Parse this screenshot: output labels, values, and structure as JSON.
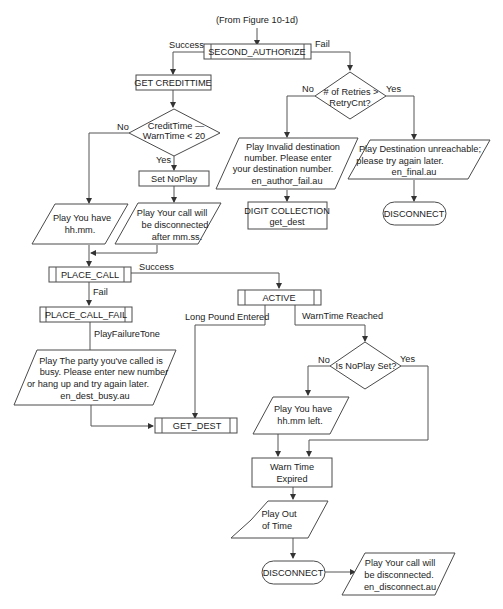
{
  "diagram": {
    "entry_label": "(From Figure 10-1d)",
    "nodes": {
      "second_authorize": "SECOND_AUTHORIZE",
      "get_credittime": "GET CREDITTIME",
      "credit_decision": [
        "CreditTime —",
        "WarnTime < 20"
      ],
      "set_noplay": "Set NoPlay",
      "play_you_have": [
        "Play  You have",
        "hh.mm."
      ],
      "play_disconnected_after": [
        "Play  Your call will",
        "be disconnected",
        "after mm.ss."
      ],
      "retries_decision": [
        "# of Retries >",
        "RetryCnt?"
      ],
      "play_invalid_dest": [
        "Play  Invalid destination",
        "number. Please enter",
        "your destination number.",
        "en_author_fail.au"
      ],
      "digit_collection": [
        "DIGIT COLLECTION",
        "get_dest"
      ],
      "play_dest_unreachable": [
        "Play  Destination unreachable;",
        "please try again later.",
        "en_final.au"
      ],
      "disconnect_top": "DISCONNECT",
      "place_call": "PLACE_CALL",
      "place_call_fail": "PLACE_CALL_FAIL",
      "play_party_busy": [
        "Play  The party you've called is",
        "busy. Please enter new number",
        "or hang up and try again later.",
        "en_dest_busy.au"
      ],
      "get_dest": "GET_DEST",
      "active": "ACTIVE",
      "noplay_decision": "Is NoPlay Set?",
      "play_hhmm_left": [
        "Play  You have",
        "hh.mm left."
      ],
      "warn_time_expired": [
        "Warn Time",
        "Expired"
      ],
      "play_out_of_time": [
        "Play  Out",
        "of Time"
      ],
      "disconnect_bottom": "DISCONNECT",
      "play_call_disconnected": [
        "Play  Your call will",
        "be disconnected.",
        "en_disconnect.au"
      ]
    },
    "edge_labels": {
      "success_1": "Success",
      "fail_1": "Fail",
      "no_credit": "No",
      "yes_credit": "Yes",
      "no_retries": "No",
      "yes_retries": "Yes",
      "success_place": "Success",
      "fail_place": "Fail",
      "play_failure_tone": "PlayFailureTone",
      "long_pound": "Long Pound Entered",
      "warntime_reached": "WarnTime Reached",
      "no_noplay": "No",
      "yes_noplay": "Yes"
    }
  }
}
